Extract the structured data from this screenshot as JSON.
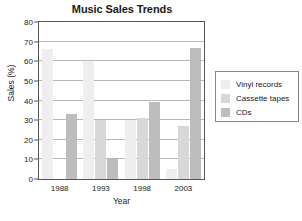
{
  "chart_data": {
    "type": "bar",
    "title": "Music Sales Trends",
    "xlabel": "Year",
    "ylabel": "Sales (%)",
    "categories": [
      "1988",
      "1993",
      "1998",
      "2003"
    ],
    "series": [
      {
        "name": "Vinyl records",
        "color": "#eeeeee",
        "values": [
          66,
          60,
          30,
          5
        ]
      },
      {
        "name": "Cassette tapes",
        "color": "#d8d8d8",
        "values": [
          0,
          30,
          31,
          27
        ]
      },
      {
        "name": "CDs",
        "color": "#bdbdbd",
        "values": [
          33,
          10,
          39,
          67
        ]
      }
    ],
    "ylim": [
      0,
      80
    ],
    "yticks": [
      0,
      10,
      20,
      30,
      40,
      50,
      60,
      70,
      80
    ],
    "grid": true,
    "legend_position": "right-outside"
  },
  "legend": {
    "items": [
      {
        "label": "Vinyl records"
      },
      {
        "label": "Cassette tapes"
      },
      {
        "label": "CDs"
      }
    ]
  }
}
